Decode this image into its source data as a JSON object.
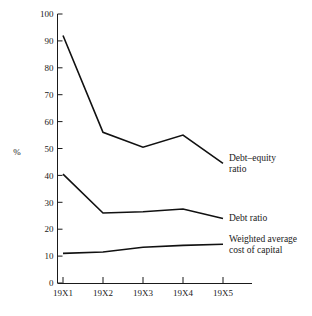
{
  "chart_data": {
    "type": "line",
    "title": "",
    "xlabel": "",
    "ylabel": "%",
    "categories": [
      "19X1",
      "19X2",
      "19X3",
      "19X4",
      "19X5"
    ],
    "ylim": [
      0,
      100
    ],
    "yticks": [
      0,
      10,
      20,
      30,
      40,
      50,
      60,
      70,
      80,
      90,
      100
    ],
    "ytick_labels": [
      "0",
      "10",
      "20",
      "30",
      "40",
      "50",
      "60",
      "70",
      "80",
      "90",
      "100"
    ],
    "grid": false,
    "legend_position": "inline-right",
    "series": [
      {
        "name": "Debt–equity ratio",
        "label_lines": [
          "Debt–equity",
          "ratio"
        ],
        "values": [
          92,
          56,
          50.5,
          55,
          44.5
        ]
      },
      {
        "name": "Debt ratio",
        "label_lines": [
          "Debt ratio"
        ],
        "values": [
          40.5,
          26,
          26.5,
          27.5,
          24
        ]
      },
      {
        "name": "Weighted average cost of capital",
        "label_lines": [
          "Weighted average",
          "cost of capital"
        ],
        "values": [
          11,
          11.5,
          13.3,
          14,
          14.4
        ]
      }
    ],
    "colors": {
      "line": "#111111",
      "axis": "#1a1a1a",
      "background": "#ffffff"
    }
  }
}
